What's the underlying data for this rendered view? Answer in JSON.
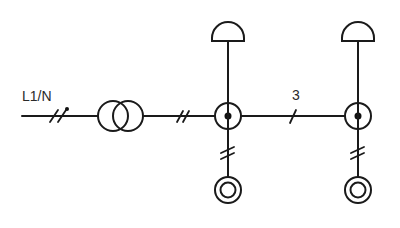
{
  "diagram": {
    "type": "electrical-installation-schematic",
    "supply_label": "L1/N",
    "conductor_count_label": "3",
    "colors": {
      "stroke": "#1a1a1a",
      "background": "#ffffff"
    },
    "components": [
      {
        "id": "supply",
        "symbol": "line-two-conductors-with-neutral-dot"
      },
      {
        "id": "transformer",
        "symbol": "two-winding-transformer"
      },
      {
        "id": "conductors-2",
        "symbol": "double-slash"
      },
      {
        "id": "junction-1",
        "symbol": "junction-box-with-connection-dot"
      },
      {
        "id": "lamp-1",
        "symbol": "pendant-luminaire-dome"
      },
      {
        "id": "outlet-1",
        "symbol": "double-circle-outlet",
        "conductors": "double-slash"
      },
      {
        "id": "conductors-3",
        "symbol": "single-slash",
        "label": "3"
      },
      {
        "id": "junction-2",
        "symbol": "junction-box-with-connection-dot"
      },
      {
        "id": "lamp-2",
        "symbol": "pendant-luminaire-dome"
      },
      {
        "id": "outlet-2",
        "symbol": "double-circle-outlet",
        "conductors": "double-slash"
      }
    ]
  }
}
